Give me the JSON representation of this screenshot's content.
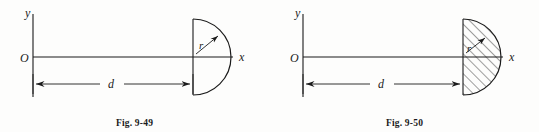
{
  "page": {
    "background_color": "#fdfdfc",
    "ink_color": "#1b1b1b",
    "width": 539,
    "height": 132
  },
  "figures": [
    {
      "id": "fig-9-49",
      "caption": "Fig. 9-49",
      "axis_label_x": "x",
      "axis_label_y": "y",
      "origin_label": "O",
      "radius_label": "r",
      "distance_label": "d",
      "shape": "semicircle",
      "filled": false,
      "hatched": false,
      "geometry": {
        "origin_x": 33,
        "axis_y": 57,
        "y_axis_top": 14,
        "y_axis_bottom": 97,
        "x_axis_right": 233,
        "center_x": 193,
        "radius": 38,
        "dimension_y": 84
      }
    },
    {
      "id": "fig-9-50",
      "caption": "Fig. 9-50",
      "axis_label_x": "x",
      "axis_label_y": "y",
      "origin_label": "O",
      "radius_label": "r",
      "distance_label": "d",
      "shape": "semicircle",
      "filled": true,
      "hatched": true,
      "hatch_angle_deg": 45,
      "geometry": {
        "origin_x": 33,
        "axis_y": 57,
        "y_axis_top": 14,
        "y_axis_bottom": 97,
        "x_axis_right": 233,
        "center_x": 193,
        "radius": 38,
        "dimension_y": 84
      }
    }
  ]
}
